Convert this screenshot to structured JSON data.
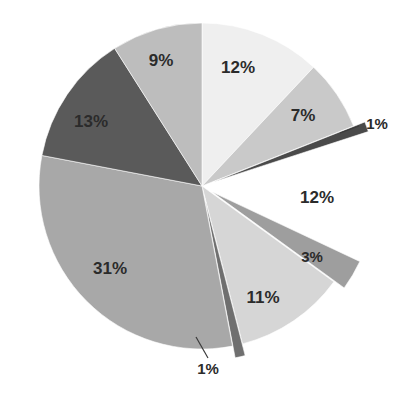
{
  "chart_data": {
    "type": "pie",
    "title": "",
    "subtitle": "",
    "xlabel": "",
    "ylabel": "",
    "legend": "none",
    "grid": false,
    "units": "percent",
    "total": 100,
    "start_angle_deg": 0,
    "direction": "clockwise",
    "center": {
      "x": 202,
      "y": 186
    },
    "radius": 163,
    "categories": [
      "Segment 1",
      "Segment 2",
      "Segment 3",
      "Segment 4",
      "Segment 5",
      "Segment 6",
      "Segment 7",
      "Segment 8",
      "Segment 9",
      "Segment 10"
    ],
    "values": [
      12,
      7,
      1,
      12,
      3,
      11,
      1,
      31,
      13,
      9
    ],
    "labels": [
      "12%",
      "7%",
      "1%",
      "12%",
      "3%",
      "11%",
      "1%",
      "31%",
      "13%",
      "9%"
    ],
    "colors": [
      "#efefef",
      "#c9c9c9",
      "#4a4a4a",
      "#ffffff",
      "#9e9e9e",
      "#d6d6d6",
      "#6f6f6f",
      "#a8a8a8",
      "#5a5a5a",
      "#bdbdbd"
    ],
    "exploded": [
      false,
      false,
      true,
      true,
      true,
      false,
      true,
      false,
      false,
      false
    ],
    "has_leader_lines": [
      false,
      false,
      true,
      false,
      false,
      false,
      true,
      false,
      false,
      false
    ],
    "slices": [
      {
        "label": "12%",
        "value": 12,
        "color": "#efefef",
        "start_deg": 0,
        "end_deg": 43.2,
        "label_pos": {
          "x": 238,
          "y": 69
        },
        "exploded": false,
        "leader": null
      },
      {
        "label": "7%",
        "value": 7,
        "color": "#c9c9c9",
        "start_deg": 43.2,
        "end_deg": 68.4,
        "label_pos": {
          "x": 303,
          "y": 117
        },
        "exploded": false,
        "leader": null
      },
      {
        "label": "1%",
        "value": 1,
        "color": "#4a4a4a",
        "start_deg": 68.4,
        "end_deg": 72.0,
        "label_pos": {
          "x": 377,
          "y": 125
        },
        "exploded": true,
        "leader": {
          "x1": 340,
          "y1": 133,
          "x2": 359,
          "y2": 126
        }
      },
      {
        "label": "12%",
        "value": 12,
        "color": "#ffffff",
        "start_deg": 72.0,
        "end_deg": 115.2,
        "label_pos": {
          "x": 317,
          "y": 199
        },
        "exploded": true,
        "leader": null
      },
      {
        "label": "3%",
        "value": 3,
        "color": "#9e9e9e",
        "start_deg": 115.2,
        "end_deg": 126.0,
        "label_pos": {
          "x": 312,
          "y": 258
        },
        "exploded": true,
        "leader": null
      },
      {
        "label": "11%",
        "value": 11,
        "color": "#d6d6d6",
        "start_deg": 126.0,
        "end_deg": 165.6,
        "label_pos": {
          "x": 263,
          "y": 299
        },
        "exploded": false,
        "leader": null
      },
      {
        "label": "1%",
        "value": 1,
        "color": "#6f6f6f",
        "start_deg": 165.6,
        "end_deg": 169.2,
        "label_pos": {
          "x": 208,
          "y": 370
        },
        "exploded": true,
        "leader": {
          "x1": 196,
          "y1": 337,
          "x2": 208,
          "y2": 358
        }
      },
      {
        "label": "31%",
        "value": 31,
        "color": "#a8a8a8",
        "start_deg": 169.2,
        "end_deg": 280.8,
        "label_pos": {
          "x": 110,
          "y": 270
        },
        "exploded": false,
        "leader": null
      },
      {
        "label": "13%",
        "value": 13,
        "color": "#5a5a5a",
        "start_deg": 280.8,
        "end_deg": 327.6,
        "label_pos": {
          "x": 91,
          "y": 123
        },
        "exploded": false,
        "leader": null
      },
      {
        "label": "9%",
        "value": 9,
        "color": "#bdbdbd",
        "start_deg": 327.6,
        "end_deg": 360.0,
        "label_pos": {
          "x": 161,
          "y": 62
        },
        "exploded": false,
        "leader": null
      }
    ]
  },
  "figure": {
    "background": "#ffffff",
    "label_color": "#2b2b2b",
    "wedge_border_color": "#ffffff"
  }
}
